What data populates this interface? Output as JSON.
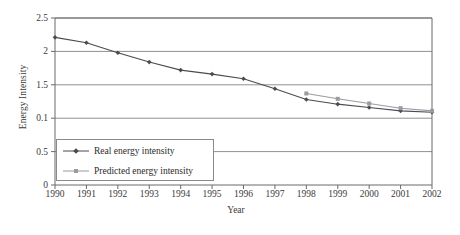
{
  "chart_data": {
    "type": "line",
    "title": "",
    "xlabel": "Year",
    "ylabel": "Energy Intensity",
    "x": [
      1990,
      1991,
      1992,
      1993,
      1994,
      1995,
      1996,
      1997,
      1998,
      1999,
      2000,
      2001,
      2002
    ],
    "categories": [
      "1990",
      "1991",
      "1992",
      "1993",
      "1994",
      "1995",
      "1996",
      "1997",
      "1998",
      "1999",
      "2000",
      "2001",
      "2002"
    ],
    "xlim": [
      1990,
      2002
    ],
    "ylim": [
      0,
      2.5
    ],
    "ytick_labels": [
      "2.5",
      "2",
      "1.5",
      "0.1",
      "0.5",
      "0"
    ],
    "ytick_values": [
      2.5,
      2.0,
      1.5,
      1.0,
      0.5,
      0.0
    ],
    "grid": "horizontal",
    "legend_position": "lower-left-inside",
    "series": [
      {
        "name": "Real energy intensity",
        "color": "#4a4a52",
        "marker": "diamond",
        "x": [
          1990,
          1991,
          1992,
          1993,
          1994,
          1995,
          1996,
          1997,
          1998,
          1999,
          2000,
          2001,
          2002
        ],
        "values": [
          2.21,
          2.13,
          1.98,
          1.84,
          1.72,
          1.66,
          1.59,
          1.44,
          1.28,
          1.21,
          1.16,
          1.11,
          1.09
        ]
      },
      {
        "name": "Predicted energy intensity",
        "color": "#9a9aa0",
        "marker": "square",
        "x": [
          1998,
          1999,
          2000,
          2001,
          2002
        ],
        "values": [
          1.37,
          1.29,
          1.22,
          1.15,
          1.11
        ]
      }
    ]
  },
  "legend": {
    "items": [
      {
        "label": "Real energy intensity"
      },
      {
        "label": "Predicted energy intensity"
      }
    ]
  },
  "colors": {
    "real": "#4a4a52",
    "predicted": "#9a9aa0",
    "grid": "#909090",
    "axis": "#6a6a6a",
    "text": "#2b2b2b",
    "background": "#ffffff"
  }
}
